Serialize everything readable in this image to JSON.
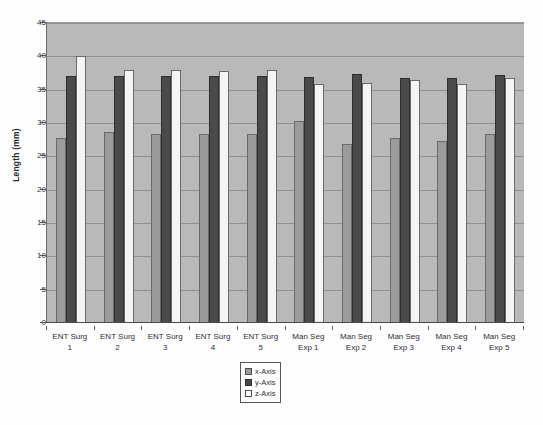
{
  "chart_data": {
    "type": "bar",
    "title": "",
    "xlabel": "",
    "ylabel": "Length (mm)",
    "ylim": [
      0,
      45
    ],
    "ytick_step": 5,
    "yticks": [
      0,
      5,
      10,
      15,
      20,
      25,
      30,
      35,
      40,
      45
    ],
    "ytick_labels": [
      "0",
      "5",
      "10",
      "15",
      "20",
      "25",
      "30",
      "35",
      "40",
      "45"
    ],
    "grid": true,
    "grid_axis": "y",
    "legend_position": "bottom-center",
    "categories": [
      "ENT Surg 1",
      "ENT Surg 2",
      "ENT Surg 3",
      "ENT Surg 4",
      "ENT Surg 5",
      "Man Seg Exp 1",
      "Man Seg Exp 2",
      "Man Seg Exp 3",
      "Man Seg Exp 4",
      "Man Seg Exp 5"
    ],
    "category_lines": [
      [
        "ENT Surg",
        "1"
      ],
      [
        "ENT Surg",
        "2"
      ],
      [
        "ENT Surg",
        "3"
      ],
      [
        "ENT Surg",
        "4"
      ],
      [
        "ENT Surg",
        "5"
      ],
      [
        "Man Seg",
        "Exp 1"
      ],
      [
        "Man Seg",
        "Exp 2"
      ],
      [
        "Man Seg",
        "Exp 3"
      ],
      [
        "Man Seg",
        "Exp 4"
      ],
      [
        "Man Seg",
        "Exp 5"
      ]
    ],
    "series": [
      {
        "name": "x-Axis",
        "color": "#9b9b9b",
        "values": [
          27.8,
          28.7,
          28.3,
          28.3,
          28.3,
          30.3,
          26.9,
          27.8,
          27.3,
          28.3
        ]
      },
      {
        "name": "y-Axis",
        "color": "#4a4a4a",
        "values": [
          37.0,
          37.0,
          37.0,
          37.0,
          37.0,
          36.9,
          37.3,
          36.7,
          36.8,
          37.2
        ]
      },
      {
        "name": "z-Axis",
        "color": "#ffffff",
        "values": [
          40.0,
          37.9,
          37.9,
          37.8,
          37.9,
          35.8,
          36.0,
          36.4,
          35.9,
          36.8
        ]
      }
    ]
  },
  "legend": {
    "items": [
      {
        "label": "x-Axis",
        "swatch": "sw-x"
      },
      {
        "label": "y-Axis",
        "swatch": "sw-y"
      },
      {
        "label": "z-Axis",
        "swatch": "sw-z"
      }
    ]
  },
  "colors": {
    "plot_background": "#b9b9b9",
    "gridline": "#8f8f8f",
    "axis": "#4a4a4a",
    "page_background": "#fdfdfd"
  }
}
